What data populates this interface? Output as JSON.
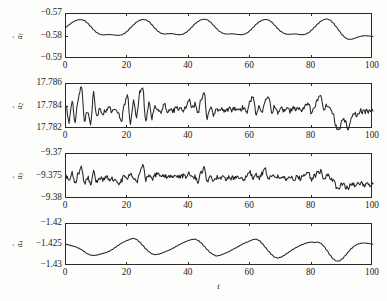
{
  "figure": {
    "xlabel": "t",
    "background": "#fdfdfb",
    "line_color": "#262626",
    "axis_color": "#2a2a2a"
  },
  "chart_data": {
    "type": "line",
    "title": "",
    "xlabel": "t",
    "ylabel": "",
    "grid": false,
    "legend": "none",
    "panels": [
      {
        "index": 1,
        "ylabel": "â1",
        "ylabel_plain": "a-hat 1",
        "ylim": [
          -0.59,
          -0.57
        ],
        "yticks": [
          -0.57,
          -0.58,
          -0.59
        ],
        "ytick_labels": [
          "−0.57",
          "−0.58",
          "−0.59"
        ],
        "xlim": [
          0,
          100
        ],
        "xticks": [
          0,
          20,
          40,
          60,
          80,
          100
        ],
        "xtick_labels": [
          "0",
          "20",
          "40",
          "60",
          "80",
          "100"
        ],
        "series": [
          {
            "name": "a1_hat",
            "x": [
              0,
              1,
              2,
              3,
              4,
              5,
              6,
              7,
              8,
              9,
              10,
              11,
              12,
              13,
              14,
              15,
              16,
              17,
              18,
              19,
              20,
              21,
              22,
              23,
              24,
              25,
              26,
              27,
              28,
              29,
              30,
              31,
              32,
              33,
              34,
              35,
              36,
              37,
              38,
              39,
              40,
              41,
              42,
              43,
              44,
              45,
              46,
              47,
              48,
              49,
              50,
              51,
              52,
              53,
              54,
              55,
              56,
              57,
              58,
              59,
              60,
              61,
              62,
              63,
              64,
              65,
              66,
              67,
              68,
              69,
              70,
              71,
              72,
              73,
              74,
              75,
              76,
              77,
              78,
              79,
              80,
              81,
              82,
              83,
              84,
              85,
              86,
              87,
              88,
              89,
              90,
              91,
              92,
              93,
              94,
              95,
              96,
              97,
              98,
              99,
              100
            ],
            "values": [
              -0.5758,
              -0.5748,
              -0.5738,
              -0.573,
              -0.5726,
              -0.5725,
              -0.5729,
              -0.574,
              -0.5755,
              -0.577,
              -0.5782,
              -0.579,
              -0.5793,
              -0.5792,
              -0.5791,
              -0.5792,
              -0.5794,
              -0.5795,
              -0.5793,
              -0.5787,
              -0.5776,
              -0.5762,
              -0.5748,
              -0.5736,
              -0.5728,
              -0.5724,
              -0.5726,
              -0.5734,
              -0.5748,
              -0.5764,
              -0.5777,
              -0.5786,
              -0.5789,
              -0.5788,
              -0.5787,
              -0.5788,
              -0.5791,
              -0.5792,
              -0.579,
              -0.5783,
              -0.5772,
              -0.5758,
              -0.5744,
              -0.5733,
              -0.5726,
              -0.5723,
              -0.5726,
              -0.5735,
              -0.5749,
              -0.5764,
              -0.5777,
              -0.5785,
              -0.5789,
              -0.5789,
              -0.5788,
              -0.5789,
              -0.5791,
              -0.5792,
              -0.579,
              -0.5784,
              -0.5773,
              -0.5759,
              -0.5745,
              -0.5734,
              -0.5727,
              -0.5724,
              -0.5727,
              -0.5736,
              -0.575,
              -0.5765,
              -0.5778,
              -0.5786,
              -0.579,
              -0.579,
              -0.5789,
              -0.5789,
              -0.5791,
              -0.5792,
              -0.579,
              -0.5783,
              -0.5772,
              -0.5758,
              -0.5744,
              -0.5732,
              -0.5725,
              -0.5722,
              -0.5727,
              -0.5739,
              -0.5756,
              -0.5775,
              -0.5793,
              -0.5806,
              -0.5812,
              -0.5812,
              -0.5808,
              -0.5803,
              -0.5799,
              -0.5797,
              -0.5797,
              -0.5798,
              -0.58
            ]
          }
        ]
      },
      {
        "index": 2,
        "ylabel": "â2",
        "ylabel_plain": "a-hat 2",
        "ylim": [
          17.782,
          17.786
        ],
        "yticks": [
          17.786,
          17.784,
          17.782
        ],
        "ytick_labels": [
          "17.786",
          "17.784",
          "17.782"
        ],
        "xlim": [
          0,
          100
        ],
        "xticks": [
          0,
          20,
          40,
          60,
          80,
          100
        ],
        "xtick_labels": [
          "0",
          "20",
          "40",
          "60",
          "80",
          "100"
        ],
        "series": [
          {
            "name": "a2_hat",
            "x": [
              0,
              1,
              2,
              3,
              4,
              5,
              6,
              7,
              8,
              9,
              10,
              11,
              12,
              13,
              14,
              15,
              16,
              17,
              18,
              19,
              20,
              21,
              22,
              23,
              24,
              25,
              26,
              27,
              28,
              29,
              30,
              31,
              32,
              33,
              34,
              35,
              36,
              37,
              38,
              39,
              40,
              41,
              42,
              43,
              44,
              45,
              46,
              47,
              48,
              49,
              50,
              51,
              52,
              53,
              54,
              55,
              56,
              57,
              58,
              59,
              60,
              61,
              62,
              63,
              64,
              65,
              66,
              67,
              68,
              69,
              70,
              71,
              72,
              73,
              74,
              75,
              76,
              77,
              78,
              79,
              80,
              81,
              82,
              83,
              84,
              85,
              86,
              87,
              88,
              89,
              90,
              91,
              92,
              93,
              94,
              95,
              96,
              97,
              98,
              99,
              100
            ],
            "values": [
              17.784,
              17.7827,
              17.7843,
              17.7826,
              17.7848,
              17.7859,
              17.7828,
              17.7836,
              17.7824,
              17.7852,
              17.783,
              17.7838,
              17.7834,
              17.7836,
              17.7839,
              17.7835,
              17.7838,
              17.7834,
              17.7826,
              17.784,
              17.785,
              17.7826,
              17.7845,
              17.7831,
              17.7852,
              17.7856,
              17.7827,
              17.7842,
              17.783,
              17.7841,
              17.7838,
              17.7836,
              17.7842,
              17.7835,
              17.7839,
              17.7836,
              17.784,
              17.7838,
              17.7836,
              17.784,
              17.7846,
              17.7838,
              17.7842,
              17.7834,
              17.7846,
              17.7853,
              17.7829,
              17.784,
              17.7833,
              17.7838,
              17.7836,
              17.7837,
              17.7835,
              17.7838,
              17.7836,
              17.7838,
              17.7836,
              17.7838,
              17.784,
              17.7835,
              17.7845,
              17.7849,
              17.7832,
              17.784,
              17.7836,
              17.7846,
              17.785,
              17.7834,
              17.784,
              17.7835,
              17.7838,
              17.7836,
              17.7838,
              17.7836,
              17.7838,
              17.7837,
              17.7839,
              17.7837,
              17.784,
              17.7843,
              17.7834,
              17.784,
              17.7846,
              17.7849,
              17.7835,
              17.7841,
              17.7839,
              17.7834,
              17.7822,
              17.7819,
              17.783,
              17.7826,
              17.7819,
              17.783,
              17.7834,
              17.7832,
              17.7836,
              17.7835,
              17.7836,
              17.7835,
              17.7836
            ]
          }
        ]
      },
      {
        "index": 3,
        "ylabel": "â3",
        "ylabel_plain": "a-hat 3",
        "ylim": [
          -9.38,
          -9.37
        ],
        "yticks": [
          -9.37,
          -9.375,
          -9.38
        ],
        "ytick_labels": [
          "−9.37",
          "−9.375",
          "−9.38"
        ],
        "xlim": [
          0,
          100
        ],
        "xticks": [
          0,
          20,
          40,
          60,
          80,
          100
        ],
        "xtick_labels": [
          "0",
          "20",
          "40",
          "60",
          "80",
          "100"
        ],
        "series": [
          {
            "name": "a3_hat",
            "x": [
              0,
              1,
              2,
              3,
              4,
              5,
              6,
              7,
              8,
              9,
              10,
              11,
              12,
              13,
              14,
              15,
              16,
              17,
              18,
              19,
              20,
              21,
              22,
              23,
              24,
              25,
              26,
              27,
              28,
              29,
              30,
              31,
              32,
              33,
              34,
              35,
              36,
              37,
              38,
              39,
              40,
              41,
              42,
              43,
              44,
              45,
              46,
              47,
              48,
              49,
              50,
              51,
              52,
              53,
              54,
              55,
              56,
              57,
              58,
              59,
              60,
              61,
              62,
              63,
              64,
              65,
              66,
              67,
              68,
              69,
              70,
              71,
              72,
              73,
              74,
              75,
              76,
              77,
              78,
              79,
              80,
              81,
              82,
              83,
              84,
              85,
              86,
              87,
              88,
              89,
              90,
              91,
              92,
              93,
              94,
              95,
              96,
              97,
              98,
              99,
              100
            ],
            "values": [
              -9.375,
              -9.3762,
              -9.3744,
              -9.3766,
              -9.3742,
              -9.3728,
              -9.3764,
              -9.3752,
              -9.3768,
              -9.374,
              -9.3762,
              -9.3752,
              -9.3756,
              -9.3752,
              -9.3756,
              -9.3754,
              -9.3758,
              -9.3768,
              -9.376,
              -9.3744,
              -9.376,
              -9.3742,
              -9.3754,
              -9.3764,
              -9.374,
              -9.3722,
              -9.3758,
              -9.3746,
              -9.3754,
              -9.3748,
              -9.374,
              -9.375,
              -9.3746,
              -9.3752,
              -9.3748,
              -9.3752,
              -9.375,
              -9.3752,
              -9.3748,
              -9.3752,
              -9.3744,
              -9.3754,
              -9.375,
              -9.376,
              -9.374,
              -9.3732,
              -9.3762,
              -9.375,
              -9.3756,
              -9.3752,
              -9.3754,
              -9.3752,
              -9.3754,
              -9.3752,
              -9.3754,
              -9.3752,
              -9.3754,
              -9.375,
              -9.3756,
              -9.3746,
              -9.3742,
              -9.3756,
              -9.3746,
              -9.3752,
              -9.3742,
              -9.3736,
              -9.3758,
              -9.3748,
              -9.3754,
              -9.375,
              -9.3754,
              -9.3752,
              -9.3754,
              -9.3752,
              -9.3754,
              -9.3752,
              -9.3754,
              -9.3752,
              -9.3748,
              -9.3744,
              -9.3756,
              -9.3748,
              -9.374,
              -9.3738,
              -9.3754,
              -9.3748,
              -9.3752,
              -9.376,
              -9.3772,
              -9.3776,
              -9.3766,
              -9.3774,
              -9.3776,
              -9.3764,
              -9.377,
              -9.3768,
              -9.3766,
              -9.3768,
              -9.3766,
              -9.3768,
              -9.3766
            ]
          }
        ]
      },
      {
        "index": 4,
        "ylabel": "â4",
        "ylabel_plain": "a-hat 4",
        "ylim": [
          -1.43,
          -1.42
        ],
        "yticks": [
          -1.42,
          -1.425,
          -1.43
        ],
        "ytick_labels": [
          "−1.42",
          "−1.425",
          "−1.43"
        ],
        "xlim": [
          0,
          100
        ],
        "xticks": [
          0,
          20,
          40,
          60,
          80,
          100
        ],
        "xtick_labels": [
          "0",
          "20",
          "40",
          "60",
          "80",
          "100"
        ],
        "series": [
          {
            "name": "a4_hat",
            "x": [
              0,
              1,
              2,
              3,
              4,
              5,
              6,
              7,
              8,
              9,
              10,
              11,
              12,
              13,
              14,
              15,
              16,
              17,
              18,
              19,
              20,
              21,
              22,
              23,
              24,
              25,
              26,
              27,
              28,
              29,
              30,
              31,
              32,
              33,
              34,
              35,
              36,
              37,
              38,
              39,
              40,
              41,
              42,
              43,
              44,
              45,
              46,
              47,
              48,
              49,
              50,
              51,
              52,
              53,
              54,
              55,
              56,
              57,
              58,
              59,
              60,
              61,
              62,
              63,
              64,
              65,
              66,
              67,
              68,
              69,
              70,
              71,
              72,
              73,
              74,
              75,
              76,
              77,
              78,
              79,
              80,
              81,
              82,
              83,
              84,
              85,
              86,
              87,
              88,
              89,
              90,
              91,
              92,
              93,
              94,
              95,
              96,
              97,
              98,
              99,
              100
            ],
            "values": [
              -1.4248,
              -1.425,
              -1.4252,
              -1.4254,
              -1.4257,
              -1.4261,
              -1.4266,
              -1.4271,
              -1.4274,
              -1.4275,
              -1.4274,
              -1.4272,
              -1.427,
              -1.4268,
              -1.4265,
              -1.4261,
              -1.4256,
              -1.4251,
              -1.4246,
              -1.4242,
              -1.4239,
              -1.4236,
              -1.4234,
              -1.4237,
              -1.4243,
              -1.4251,
              -1.4259,
              -1.4266,
              -1.4271,
              -1.4273,
              -1.4272,
              -1.427,
              -1.4267,
              -1.4264,
              -1.4261,
              -1.4257,
              -1.4253,
              -1.4249,
              -1.4245,
              -1.4242,
              -1.4239,
              -1.4237,
              -1.4236,
              -1.4239,
              -1.4245,
              -1.4253,
              -1.4261,
              -1.4268,
              -1.4273,
              -1.4276,
              -1.4275,
              -1.4272,
              -1.4269,
              -1.4266,
              -1.4262,
              -1.4258,
              -1.4254,
              -1.425,
              -1.4246,
              -1.4243,
              -1.424,
              -1.4237,
              -1.4236,
              -1.424,
              -1.4247,
              -1.4256,
              -1.4265,
              -1.4273,
              -1.4279,
              -1.4281,
              -1.4279,
              -1.4275,
              -1.427,
              -1.4265,
              -1.426,
              -1.4256,
              -1.4252,
              -1.4249,
              -1.4246,
              -1.4244,
              -1.4243,
              -1.4244,
              -1.4243,
              -1.4246,
              -1.4253,
              -1.4263,
              -1.4274,
              -1.4283,
              -1.4288,
              -1.4288,
              -1.4283,
              -1.4275,
              -1.4266,
              -1.4258,
              -1.4252,
              -1.4248,
              -1.4246,
              -1.4245,
              -1.4246,
              -1.4247,
              -1.4248
            ]
          }
        ]
      }
    ]
  }
}
